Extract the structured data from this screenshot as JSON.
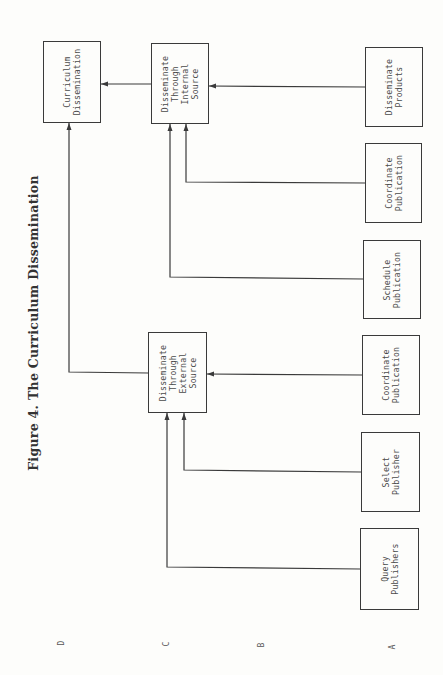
{
  "title": "Figure 4. The Curriculum Dissemination",
  "levels": [
    {
      "id": "D",
      "label": "D",
      "x": 61,
      "y": 643
    },
    {
      "id": "C",
      "label": "C",
      "x": 166,
      "y": 644
    },
    {
      "id": "B",
      "label": "B",
      "x": 261,
      "y": 645
    },
    {
      "id": "A",
      "label": "A",
      "x": 392,
      "y": 647
    }
  ],
  "nodes": {
    "curriculum_dissemination": {
      "label": "Curriculum\nDissemination",
      "level": "D",
      "x": 43,
      "y": 41,
      "w": 58,
      "h": 82
    },
    "internal_source": {
      "label": "Disseminate\nThrough\nInternal\nSource",
      "level": "C",
      "x": 151,
      "y": 43,
      "w": 58,
      "h": 81
    },
    "external_source": {
      "label": "Disseminate\nThrough\nExternal\nSource",
      "level": "C",
      "x": 148,
      "y": 332,
      "w": 59,
      "h": 81
    },
    "disseminate_products": {
      "label": "Disseminate\nProducts",
      "level": "A",
      "x": 365,
      "y": 47,
      "w": 58,
      "h": 80
    },
    "coordinate_publication_internal": {
      "label": "Coordinate\nPublication",
      "level": "A",
      "x": 365,
      "y": 143,
      "w": 57,
      "h": 80
    },
    "schedule_publication": {
      "label": "Schedule\nPublication",
      "level": "A",
      "x": 363,
      "y": 240,
      "w": 58,
      "h": 79
    },
    "coordinate_publication_external": {
      "label": "Coordinate\nPublication",
      "level": "A",
      "x": 362,
      "y": 335,
      "w": 58,
      "h": 80
    },
    "select_publisher": {
      "label": "Select\nPublisher",
      "level": "A",
      "x": 361,
      "y": 432,
      "w": 59,
      "h": 80
    },
    "query_publishers": {
      "label": "Query\nPublishers",
      "level": "A",
      "x": 360,
      "y": 528,
      "w": 59,
      "h": 82
    }
  },
  "edges": [
    {
      "from": "internal_source",
      "to": "curriculum_dissemination",
      "points": [
        [
          151,
          84
        ],
        [
          101,
          84
        ]
      ]
    },
    {
      "from": "disseminate_products",
      "to": "internal_source",
      "points": [
        [
          365,
          87
        ],
        [
          209,
          86
        ]
      ]
    },
    {
      "from": "coordinate_publication_internal",
      "to": "internal_source",
      "points": [
        [
          365,
          183
        ],
        [
          186,
          182
        ],
        [
          186,
          124
        ]
      ]
    },
    {
      "from": "schedule_publication",
      "to": "internal_source",
      "points": [
        [
          363,
          279
        ],
        [
          170,
          277
        ],
        [
          170,
          124
        ]
      ]
    },
    {
      "from": "external_source",
      "to": "curriculum_dissemination",
      "points": [
        [
          148,
          373
        ],
        [
          69,
          372
        ],
        [
          69,
          123
        ]
      ]
    },
    {
      "from": "coordinate_publication_external",
      "to": "external_source",
      "points": [
        [
          362,
          375
        ],
        [
          207,
          374
        ]
      ]
    },
    {
      "from": "select_publisher",
      "to": "external_source",
      "points": [
        [
          361,
          472
        ],
        [
          184,
          470
        ],
        [
          184,
          413
        ]
      ]
    },
    {
      "from": "query_publishers",
      "to": "external_source",
      "points": [
        [
          360,
          569
        ],
        [
          167,
          567
        ],
        [
          167,
          413
        ]
      ]
    }
  ],
  "colors": {
    "line": "#3a3a3a",
    "text": "#4a4a4a",
    "background": "#fdfdfb"
  }
}
